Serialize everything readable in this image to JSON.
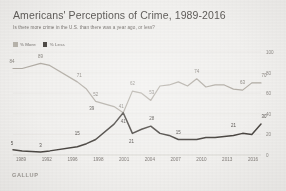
{
  "header": {
    "title": "Americans' Perceptions of Crime, 1989-2016",
    "subtitle": "Is there more crime in the U.S. than there was a year ago, or less?"
  },
  "brand": {
    "name": "GALLUP"
  },
  "legend": {
    "position": "top-left",
    "items": [
      {
        "label": "% More",
        "color": "#b9b5ad"
      },
      {
        "label": "% Less",
        "color": "#4f4b47"
      }
    ]
  },
  "colors": {
    "background": "#f2f1ef",
    "more_line": "#b2ada5",
    "less_line": "#4a4642",
    "gridline": "#e7e5e2",
    "axis_text": "#807c78",
    "title_text": "#5d5a57"
  },
  "chart_data": {
    "type": "line",
    "title": "Americans' Perceptions of Crime, 1989-2016",
    "subtitle": "Is there more crime in the U.S. than there was a year ago, or less?",
    "xlabel": "",
    "ylabel": "",
    "ylim": [
      0,
      100
    ],
    "yticks": [
      0,
      20,
      40,
      60,
      80,
      100
    ],
    "grid": true,
    "legend_position": "top-left",
    "x": [
      1989,
      1990,
      1992,
      1993,
      1996,
      1997,
      1998,
      2000,
      2001,
      2002,
      2003,
      2004,
      2005,
      2006,
      2007,
      2008,
      2009,
      2010,
      2011,
      2012,
      2013,
      2014,
      2015,
      2016
    ],
    "xticks": [
      "1989",
      "1992",
      "1996",
      "1998",
      "2001",
      "2004",
      "2007",
      "2010",
      "2013",
      "2016"
    ],
    "series": [
      {
        "name": "% More",
        "color": "#b2ada5",
        "values": [
          84,
          84,
          89,
          87,
          71,
          64,
          52,
          47,
          41,
          62,
          60,
          53,
          67,
          68,
          71,
          67,
          74,
          66,
          68,
          68,
          64,
          63,
          70,
          70
        ],
        "labeled_points": [
          {
            "x": 1989,
            "value": 84
          },
          {
            "x": 1992,
            "value": 89
          },
          {
            "x": 1996,
            "value": 71
          },
          {
            "x": 1998,
            "value": 52
          },
          {
            "x": 2001,
            "value": 41
          },
          {
            "x": 2002,
            "value": 62
          },
          {
            "x": 2004,
            "value": 53
          },
          {
            "x": 2009,
            "value": 74
          },
          {
            "x": 2014,
            "value": 63
          },
          {
            "x": 2016,
            "value": 70
          }
        ]
      },
      {
        "name": "% Less",
        "color": "#4a4642",
        "values": [
          5,
          4,
          3,
          4,
          8,
          11,
          15,
          30,
          41,
          21,
          25,
          28,
          21,
          19,
          15,
          15,
          15,
          17,
          17,
          18,
          19,
          21,
          20,
          30
        ],
        "labeled_points": [
          {
            "x": 1989,
            "value": 5
          },
          {
            "x": 1992,
            "value": 3
          },
          {
            "x": 1996,
            "value": 15
          },
          {
            "x": 1998,
            "value": 39
          },
          {
            "x": 2001,
            "value": 41
          },
          {
            "x": 2002,
            "value": 21
          },
          {
            "x": 2004,
            "value": 28
          },
          {
            "x": 2007,
            "value": 15
          },
          {
            "x": 2013,
            "value": 21
          },
          {
            "x": 2016,
            "value": 30
          }
        ]
      }
    ]
  }
}
